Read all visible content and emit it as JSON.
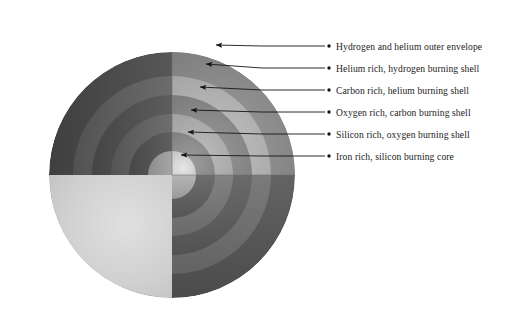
{
  "figure": {
    "background_color": "#ffffff",
    "sphere": {
      "center_x": 172,
      "center_y": 175,
      "radius": 123,
      "surface_light_color": "#d2d2d2",
      "surface_mid_color": "#a8a8a8",
      "surface_dark_color": "#8f8f8f",
      "highlight_x": 110,
      "highlight_y": 240
    }
  },
  "shells": [
    {
      "index": 1,
      "name": "hydrogen-helium-outer-envelope",
      "label": "Hydrogen and helium outer envelope",
      "face_color": "#8c8c8c",
      "wall_color": "#4a4a4a",
      "outer_radius": 123,
      "inner_radius": 99,
      "arrow_tip_x": 216,
      "arrow_tip_y": 45,
      "label_x": 336,
      "label_y": 41
    },
    {
      "index": 2,
      "name": "helium-rich-hydrogen-burning-shell",
      "label": "Helium rich, hydrogen burning shell",
      "face_color": "#b4b4b4",
      "wall_color": "#5e5e5e",
      "outer_radius": 99,
      "inner_radius": 80,
      "arrow_tip_x": 206,
      "arrow_tip_y": 64,
      "label_x": 336,
      "label_y": 63
    },
    {
      "index": 3,
      "name": "carbon-rich-helium-burning-shell",
      "label": "Carbon rich, helium burning shell",
      "face_color": "#8a8a8a",
      "wall_color": "#4f4f4f",
      "outer_radius": 80,
      "inner_radius": 61,
      "arrow_tip_x": 200,
      "arrow_tip_y": 87,
      "label_x": 336,
      "label_y": 85
    },
    {
      "index": 4,
      "name": "oxygen-rich-carbon-burning-shell",
      "label": "Oxygen rich, carbon burning shell",
      "face_color": "#b0b0b0",
      "wall_color": "#606060",
      "outer_radius": 61,
      "inner_radius": 43,
      "arrow_tip_x": 191,
      "arrow_tip_y": 110,
      "label_x": 336,
      "label_y": 107
    },
    {
      "index": 5,
      "name": "silicon-rich-oxygen-burning-shell",
      "label": "Silicon rich, oxygen burning shell",
      "face_color": "#8e8e8e",
      "wall_color": "#525252",
      "outer_radius": 43,
      "inner_radius": 24,
      "arrow_tip_x": 188,
      "arrow_tip_y": 132,
      "label_x": 336,
      "label_y": 129
    },
    {
      "index": 6,
      "name": "iron-rich-silicon-burning-core",
      "label": "Iron rich, silicon burning core",
      "face_color": "#cfcfcf",
      "wall_color": "#9a9a9a",
      "outer_radius": 24,
      "inner_radius": 0,
      "arrow_tip_x": 181,
      "arrow_tip_y": 155,
      "label_x": 336,
      "label_y": 151
    }
  ],
  "leaders": {
    "line_color": "#151515",
    "line_width": 0.9,
    "bullet_color": "#151515",
    "bullet_radius": 1.7,
    "bullet_x": 329,
    "elbow_x": 262
  }
}
